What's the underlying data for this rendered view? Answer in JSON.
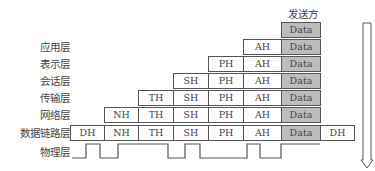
{
  "sender_label": "发送方",
  "layers": [
    {
      "name": "应用层",
      "headers": [
        "AH"
      ],
      "data": "Data",
      "trailer": null
    },
    {
      "name": "表示层",
      "headers": [
        "PH",
        "AH"
      ],
      "data": "Data",
      "trailer": null
    },
    {
      "name": "会话层",
      "headers": [
        "SH",
        "PH",
        "AH"
      ],
      "data": "Data",
      "trailer": null
    },
    {
      "name": "传输层",
      "headers": [
        "TH",
        "SH",
        "PH",
        "AH"
      ],
      "data": "Data",
      "trailer": null
    },
    {
      "name": "网络层",
      "headers": [
        "NH",
        "TH",
        "SH",
        "PH",
        "AH"
      ],
      "data": "Data",
      "trailer": null
    },
    {
      "name": "数据链路层",
      "headers": [
        "DH",
        "NH",
        "TH",
        "SH",
        "PH",
        "AH"
      ],
      "data": "Data",
      "trailer": "DH"
    },
    {
      "name": "物理层",
      "headers": [],
      "data": null,
      "trailer": null
    }
  ],
  "top_data": "Data",
  "colors": {
    "data_fill": "#bdbdbd",
    "border": "#555555",
    "text": "#444444"
  },
  "labels": {
    "app": "应用层",
    "pres": "表示层",
    "sess": "会话层",
    "trans": "传输层",
    "net": "网络层",
    "link": "数据链路层",
    "phys": "物理层"
  },
  "cells": {
    "r0": {
      "data": "Data"
    },
    "r1": {
      "ah": "AH",
      "data": "Data"
    },
    "r2": {
      "ph": "PH",
      "ah": "AH",
      "data": "Data"
    },
    "r3": {
      "sh": "SH",
      "ph": "PH",
      "ah": "AH",
      "data": "Data"
    },
    "r4": {
      "th": "TH",
      "sh": "SH",
      "ph": "PH",
      "ah": "AH",
      "data": "Data"
    },
    "r5": {
      "nh": "NH",
      "th": "TH",
      "sh": "SH",
      "ph": "PH",
      "ah": "AH",
      "data": "Data"
    },
    "r6": {
      "dh": "DH",
      "nh": "NH",
      "th": "TH",
      "sh": "SH",
      "ph": "PH",
      "ah": "AH",
      "data": "Data",
      "dt": "DH"
    }
  }
}
